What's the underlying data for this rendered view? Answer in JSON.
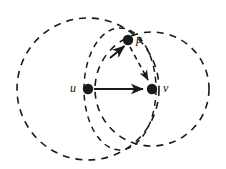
{
  "figure": {
    "background": "#ffffff",
    "stroke_color": "#1a1a1a",
    "width": 226,
    "height": 169
  },
  "labels": {
    "u": "u",
    "v": "v",
    "p": "p"
  },
  "nodes": [
    {
      "id": "u",
      "label": "u",
      "cx": 88,
      "cy": 89,
      "r": 5.2,
      "label_x": 72,
      "label_y": 83
    },
    {
      "id": "v",
      "label": "v",
      "cx": 152,
      "cy": 89,
      "r": 5.2,
      "label_x": 163,
      "label_y": 83
    },
    {
      "id": "p",
      "label": "p",
      "cx": 128,
      "cy": 40,
      "r": 5.2,
      "label_x": 137,
      "label_y": 35
    }
  ],
  "edges": [
    {
      "from": "u",
      "to": "v",
      "style": "solid",
      "arrow": "end"
    },
    {
      "from": "u",
      "to": "p",
      "style": "solid",
      "arrow": "end"
    },
    {
      "from": "p",
      "to": "v",
      "style": "dashed",
      "arrow": "end"
    }
  ],
  "circles": [
    {
      "id": "disk-u",
      "cx": 88,
      "cy": 89,
      "r": 71,
      "style": "dashed"
    },
    {
      "id": "disk-v",
      "cx": 152,
      "cy": 89,
      "r": 57,
      "style": "dashed"
    },
    {
      "id": "lens-ellipse",
      "cx": 120,
      "cy": 89,
      "rx": 36,
      "ry": 61,
      "style": "dashed"
    }
  ],
  "colors": {
    "ink": "#1a1a1a",
    "paper": "#ffffff"
  }
}
